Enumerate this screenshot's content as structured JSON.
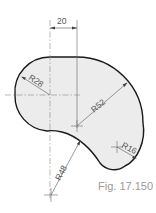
{
  "figure": {
    "caption": "Fig. 17.150",
    "dimensions": {
      "horizontal_offset": "20",
      "r_small_left": "R28",
      "r_large": "R52",
      "r_concave": "R48",
      "r_tip": "R16"
    }
  },
  "colors": {
    "fill": "#ececec",
    "outline": "#1a1a1a",
    "construction": "#8a8a8a",
    "caption": "#9a9a9a"
  }
}
